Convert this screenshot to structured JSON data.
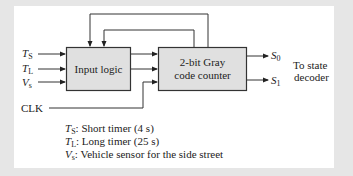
{
  "diagram": {
    "inputs": [
      {
        "symbol": "T",
        "sub": "S"
      },
      {
        "symbol": "T",
        "sub": "L"
      },
      {
        "symbol": "V",
        "sub": "s"
      }
    ],
    "clock_label": "CLK",
    "blocks": {
      "input_logic": "Input logic",
      "counter_line1": "2-bit Gray",
      "counter_line2": "code counter"
    },
    "outputs": [
      {
        "symbol": "S",
        "sub": "0"
      },
      {
        "symbol": "S",
        "sub": "1"
      }
    ],
    "output_note_line1": "To state",
    "output_note_line2": "decoder",
    "legend": [
      {
        "symbol": "T",
        "sub": "S",
        "text": ": Short timer (4 s)"
      },
      {
        "symbol": "T",
        "sub": "L",
        "text": ": Long timer (25 s)"
      },
      {
        "symbol": "V",
        "sub": "s",
        "text": ": Vehicle sensor for the side street"
      }
    ]
  }
}
